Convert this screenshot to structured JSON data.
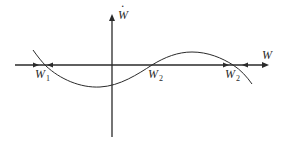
{
  "diagram": {
    "type": "phase-line",
    "axes": {
      "x_label": "W",
      "y_label": "Ẇ",
      "y_label_base": "W",
      "y_label_accent": "·"
    },
    "equilibria": [
      {
        "base": "W",
        "sub": "1",
        "stability": "stable"
      },
      {
        "base": "W",
        "sub": "2",
        "stability": "unstable"
      },
      {
        "base": "W",
        "sub": "2",
        "stability": "stable"
      }
    ],
    "flow_arrows": [
      {
        "position": "left of first equilibrium",
        "direction": "right"
      },
      {
        "position": "right of first equilibrium",
        "direction": "left"
      },
      {
        "position": "left of third equilibrium",
        "direction": "right"
      },
      {
        "position": "right of third equilibrium",
        "direction": "left"
      }
    ],
    "colors": {
      "ink": "#2a2a2a",
      "background": "#ffffff"
    }
  }
}
